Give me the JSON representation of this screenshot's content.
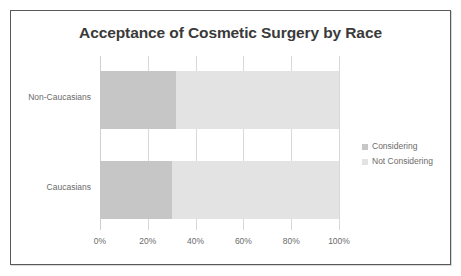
{
  "chart_data": {
    "type": "bar",
    "orientation": "horizontal",
    "stacked": true,
    "percent_stacked": true,
    "title": "Acceptance of Cosmetic Surgery by Race",
    "xlabel": "",
    "ylabel": "",
    "xlim": [
      0,
      100
    ],
    "xticks": [
      "0%",
      "20%",
      "40%",
      "60%",
      "80%",
      "100%"
    ],
    "xtick_values": [
      0,
      20,
      40,
      60,
      80,
      100
    ],
    "grid": true,
    "legend_position": "right",
    "categories": [
      "Non-Caucasians",
      "Caucasians"
    ],
    "series": [
      {
        "name": "Considering",
        "color": "#c6c6c6",
        "values": [
          32,
          30
        ]
      },
      {
        "name": "Not Considering",
        "color": "#e3e3e3",
        "values": [
          68,
          70
        ]
      }
    ],
    "colors": {
      "considering": "#c6c6c6",
      "not_considering": "#e3e3e3",
      "gridline": "#d8d8d8",
      "title_text": "#3a3a3a",
      "axis_text": "#6b6b6b",
      "frame_border": "#595959",
      "background": "#ffffff"
    }
  }
}
